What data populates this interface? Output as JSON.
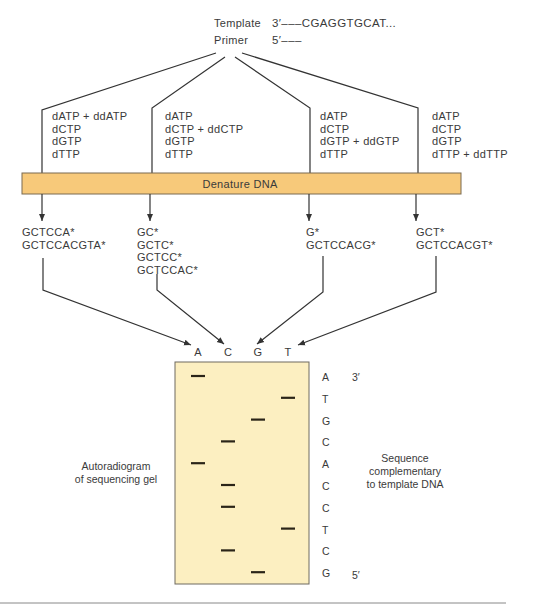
{
  "header": {
    "template_label": "Template",
    "template_seq": "3′–––CGAGGTGCAT...",
    "primer_label": "Primer",
    "primer_seq": "5′–––"
  },
  "reactions": [
    {
      "lines": [
        "dATP + ddATP",
        "dCTP",
        "dGTP",
        "dTTP"
      ],
      "products": [
        "GCTCCA*",
        "GCTCCACGTA*"
      ],
      "lane": "A"
    },
    {
      "lines": [
        "dATP",
        "dCTP + ddCTP",
        "dGTP",
        "dTTP"
      ],
      "products": [
        "GC*",
        "GCTC*",
        "GCTCC*",
        "GCTCCAC*"
      ],
      "lane": "C"
    },
    {
      "lines": [
        "dATP",
        "dCTP",
        "dGTP + ddGTP",
        "dTTP"
      ],
      "products": [
        "G*",
        "GCTCCACG*"
      ],
      "lane": "G"
    },
    {
      "lines": [
        "dATP",
        "dCTP",
        "dGTP",
        "dTTP + ddTTP"
      ],
      "products": [
        "GCT*",
        "GCTCCACGT*"
      ],
      "lane": "T"
    }
  ],
  "denature_label": "Denature DNA",
  "gel": {
    "lane_labels": [
      "A",
      "C",
      "G",
      "T"
    ],
    "bands": [
      "A",
      "T",
      "G",
      "C",
      "A",
      "C",
      "C",
      "T",
      "C",
      "G"
    ],
    "read_sequence": [
      "A",
      "T",
      "G",
      "C",
      "A",
      "C",
      "C",
      "T",
      "C",
      "G"
    ],
    "top_end": "3′",
    "bottom_end": "5′",
    "left_caption": [
      "Autoradiogram",
      "of sequencing gel"
    ],
    "right_caption": [
      "Sequence",
      "complementary",
      "to template DNA"
    ]
  },
  "colors": {
    "denature_bar": "#f7c97a",
    "gel_fill": "#fcefc1",
    "band": "#2a2418",
    "line": "#333333"
  }
}
